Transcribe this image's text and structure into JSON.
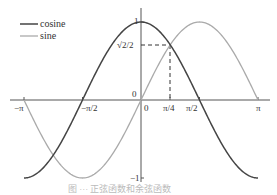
{
  "chart_data": {
    "type": "line",
    "title": "",
    "xlabel": "",
    "ylabel": "",
    "xlim": [
      -3.2,
      3.35
    ],
    "ylim": [
      -1.05,
      1.05
    ],
    "grid": false,
    "legend_position": "upper-left",
    "x_ticks": [
      {
        "value": -3.14159,
        "label": "−π"
      },
      {
        "value": -1.5708,
        "label": "−π/2"
      },
      {
        "value": 0,
        "label": "0"
      },
      {
        "value": 0.7854,
        "label": "π/4"
      },
      {
        "value": 1.5708,
        "label": "π/2"
      },
      {
        "value": 3.14159,
        "label": "π"
      }
    ],
    "y_ticks": [
      {
        "value": 1,
        "label": "1"
      },
      {
        "value": 0.7071,
        "label": "√2/2"
      },
      {
        "value": 0,
        "label": "0"
      },
      {
        "value": -1,
        "label": "−1"
      }
    ],
    "series": [
      {
        "name": "cosine",
        "function": "cos(x)",
        "color": "#444444",
        "x_range": [
          -3.14159,
          3.14159
        ]
      },
      {
        "name": "sine",
        "function": "sin(x)",
        "color": "#aaaaaa",
        "x_range": [
          -3.14159,
          3.14159
        ]
      }
    ],
    "annotations": [
      {
        "type": "dashed-guide",
        "point": [
          0.7854,
          0.7071
        ],
        "label": "intersection at (π/4, √2/2)"
      }
    ]
  },
  "legend": {
    "cosine": "cosine",
    "sine": "sine"
  },
  "axis_labels": {
    "neg_pi": "−π",
    "neg_half_pi": "−π/2",
    "zero_x": "0",
    "zero_y": "0",
    "quarter_pi": "π/4",
    "half_pi": "π/2",
    "pi": "π",
    "one": "1",
    "sqrt2_over_2": "√2/2",
    "neg_one": "−1"
  },
  "caption": "图 ··· 正弦函数和余弦函数"
}
